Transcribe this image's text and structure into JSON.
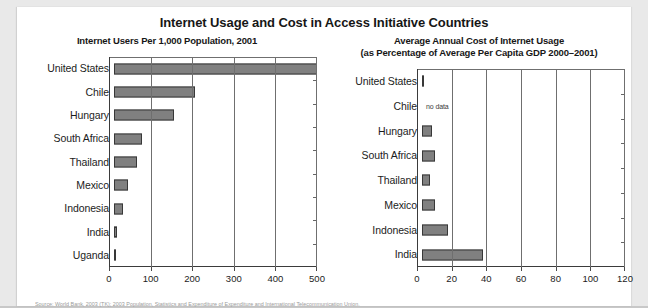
{
  "document": {
    "title": "Internet Usage and Cost in Access Initiative Countries",
    "source_note": "Source: World Bank, 2003 (TK); 2003 Population, Statistics and Expenditure of Expenditure and International Telecommunication Union."
  },
  "chart_data": [
    {
      "id": "internet-users",
      "type": "bar",
      "orientation": "horizontal",
      "title": "Internet Users Per 1,000 Population, 2001",
      "xlabel": "",
      "ylabel": "",
      "xlim": [
        0,
        500
      ],
      "ticks": [
        0,
        100,
        200,
        300,
        400,
        500
      ],
      "grid": true,
      "legend": "none",
      "categories": [
        "United States",
        "Chile",
        "Hungary",
        "South Africa",
        "Thailand",
        "Mexico",
        "Indonesia",
        "India",
        "Uganda"
      ],
      "values": [
        499,
        200,
        148,
        70,
        56,
        35,
        21,
        8,
        2
      ],
      "bar_color": "#808080",
      "bar_border": "#383838"
    },
    {
      "id": "internet-cost",
      "type": "bar",
      "orientation": "horizontal",
      "title_line1": "Average Annual Cost of Internet Usage",
      "title_line2": "(as Percentage of Average Per Capita GDP 2000–2001)",
      "xlabel": "",
      "ylabel": "",
      "xlim": [
        0,
        120
      ],
      "ticks": [
        0,
        20,
        40,
        60,
        80,
        100,
        120
      ],
      "grid": true,
      "legend": "none",
      "categories": [
        "United States",
        "Chile",
        "Hungary",
        "South Africa",
        "Thailand",
        "Mexico",
        "Indonesia",
        "India"
      ],
      "values": [
        1.2,
        null,
        6.0,
        7.5,
        4.5,
        7.5,
        15.5,
        36.0
      ],
      "missing_label": "no data",
      "bar_color": "#808080",
      "bar_border": "#383838"
    }
  ]
}
